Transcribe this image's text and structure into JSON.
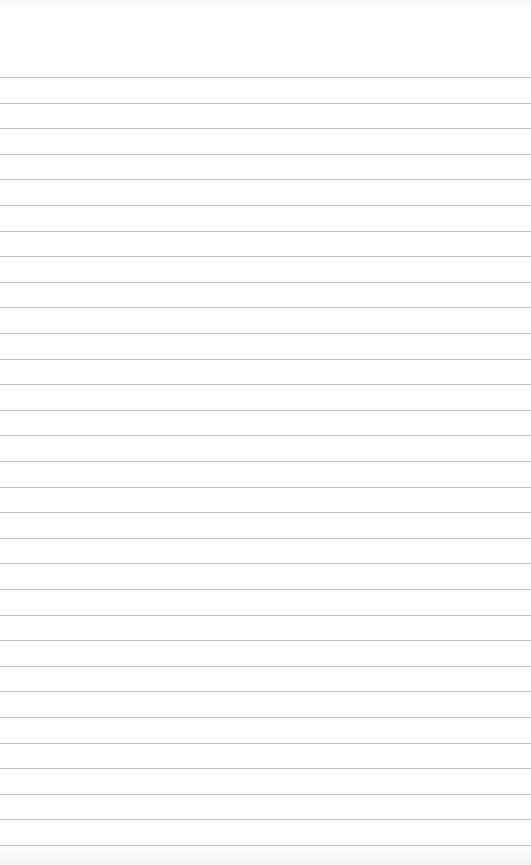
{
  "paper": {
    "type": "lined-notepad-sheet",
    "background_color": "#fefefe",
    "line_color": "#b9b9b9",
    "line_count": 31,
    "first_line_y": 77,
    "line_spacing": 25.6,
    "text_content": ""
  }
}
